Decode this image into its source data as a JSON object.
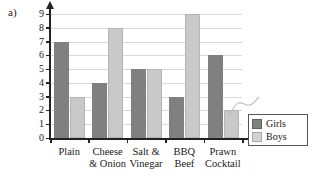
{
  "part_label": "a)",
  "chart_data": {
    "type": "bar",
    "title": "",
    "xlabel": "",
    "ylabel": "Number of people",
    "ylim": [
      0,
      9
    ],
    "yticks": [
      0,
      1,
      2,
      3,
      4,
      5,
      6,
      7,
      8,
      9
    ],
    "grid": true,
    "legend_position": "bottom-right",
    "categories": [
      "Plain",
      "Cheese & Onion",
      "Salt & Vinegar",
      "BBQ Beef",
      "Prawn Cocktail"
    ],
    "category_lines": [
      [
        "Plain",
        ""
      ],
      [
        "Cheese",
        "& Onion"
      ],
      [
        "Salt &",
        "Vinegar"
      ],
      [
        "BBQ",
        "Beef"
      ],
      [
        "Prawn",
        "Cocktail"
      ]
    ],
    "series": [
      {
        "name": "Girls",
        "color": "#808080",
        "values": [
          7,
          4,
          5,
          3,
          6
        ]
      },
      {
        "name": "Boys",
        "color": "#c9c9c9",
        "values": [
          3,
          8,
          5,
          9,
          2
        ]
      }
    ]
  }
}
